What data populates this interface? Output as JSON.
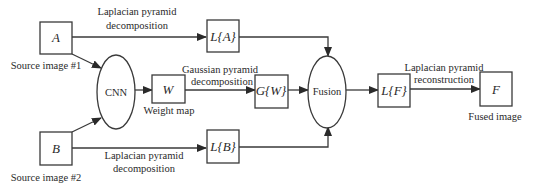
{
  "diagram": {
    "nodes": {
      "a": {
        "label": "A",
        "caption": "Source image #1"
      },
      "b": {
        "label": "B",
        "caption": "Source image #2"
      },
      "cnn": {
        "label": "CNN"
      },
      "w": {
        "label": "W",
        "caption": "Weight map"
      },
      "la": {
        "label": "L{A}"
      },
      "lb": {
        "label": "L{B}"
      },
      "gw": {
        "label": "G{W}"
      },
      "fusion": {
        "label": "Fusion"
      },
      "lf": {
        "label": "L{F}"
      },
      "f": {
        "label": "F",
        "caption": "Fused image"
      }
    },
    "edges": {
      "a_to_la": {
        "line1": "Laplacian pyramid",
        "line2": "decomposition"
      },
      "b_to_lb": {
        "line1": "Laplacian pyramid",
        "line2": "decomposition"
      },
      "w_to_gw": {
        "line1": "Gaussian pyramid",
        "line2": "decomposition"
      },
      "lf_to_f": {
        "line1": "Laplacian pyramid",
        "line2": "reconstruction"
      }
    }
  }
}
